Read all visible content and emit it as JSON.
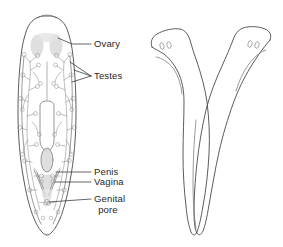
{
  "figure": {
    "background_color": "#ffffff",
    "outline_color": "#4a4a4a",
    "label_color": "#262626",
    "shade_color": "#d9d9d9"
  },
  "left_diagram": {
    "name": "planarian-internal-anatomy",
    "description": "Dorsal view of a planarian flatworm showing reproductive organs",
    "labels": [
      {
        "id": "ovary",
        "text": "Ovary",
        "x": 94,
        "y": 47,
        "leader_from_x": 72,
        "leader_from_y": 44,
        "leader_to_x": 91,
        "leader_to_y": 44
      },
      {
        "id": "testes",
        "text": "Testes",
        "x": 94,
        "y": 76,
        "leader_from_x": 58,
        "leader_from_y": 70,
        "leader_to_x": 91,
        "leader_to_y": 76
      },
      {
        "id": "penis",
        "text": "Penis",
        "x": 94,
        "y": 174,
        "leader_from_x": 56,
        "leader_from_y": 172,
        "leader_to_x": 91,
        "leader_to_y": 172
      },
      {
        "id": "vagina",
        "text": "Vagina",
        "x": 94,
        "y": 184,
        "leader_from_x": 55,
        "leader_from_y": 182,
        "leader_to_x": 91,
        "leader_to_y": 182
      },
      {
        "id": "genital-pore-line1",
        "text": "Genital",
        "x": 94,
        "y": 201
      },
      {
        "id": "genital-pore-line2",
        "text": "pore",
        "x": 105,
        "y": 212
      }
    ],
    "organs": [
      {
        "id": "ovary-pair",
        "label": "Ovary"
      },
      {
        "id": "testes-follicles",
        "label": "Testes"
      },
      {
        "id": "pharynx",
        "label": "Pharynx"
      },
      {
        "id": "penis-bulb",
        "label": "Penis"
      },
      {
        "id": "vagina-duct",
        "label": "Vagina"
      },
      {
        "id": "genital-pore-opening",
        "label": "Genital pore"
      }
    ]
  },
  "right_diagram": {
    "name": "mating-planarian-pair",
    "description": "Two planarians in V-shaped mating position, heads apart, tails joined",
    "specimens": [
      {
        "id": "left-worm",
        "eyespot_count": 2,
        "head_side": "left"
      },
      {
        "id": "right-worm",
        "eyespot_count": 2,
        "head_side": "right"
      }
    ]
  }
}
